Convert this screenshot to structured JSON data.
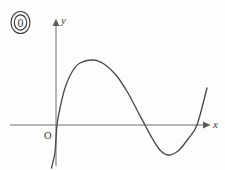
{
  "figure": {
    "tag_label": "0",
    "tag_icon": "circled-zero-icon",
    "background_color": "#fdfdfc",
    "axis_color": "#6e6e6e",
    "curve_color": "#4a4a4a",
    "width": 225,
    "height": 170
  },
  "axes": {
    "x_label": "x",
    "y_label": "y",
    "origin_label": "O",
    "x_axis_y_px": 125,
    "y_axis_x_px": 56,
    "x_axis_start_px": 10,
    "x_axis_end_px": 207,
    "y_axis_top_px": 22,
    "y_axis_bottom_px": 166,
    "x_arrow": "arrow-right-icon",
    "y_arrow": "arrow-up-icon"
  },
  "chart_data": {
    "type": "line",
    "title": "",
    "subtitle": "",
    "xlabel": "x",
    "ylabel": "y",
    "grid": false,
    "legend": false,
    "legend_position": "none",
    "axis_style": "arrowed-cartesian",
    "origin_label": "O",
    "xlim": [
      -0.35,
      4.05
    ],
    "ylim": [
      -1.55,
      1.55
    ],
    "x_roots": [
      0.02,
      1.97,
      3.15
    ],
    "local_maximum": {
      "x": 0.83,
      "y": 1.44
    },
    "local_minimum": {
      "x": 2.5,
      "y": -0.66
    },
    "series": [
      {
        "name": "curve",
        "x": [
          -0.09,
          0.02,
          0.2,
          0.4,
          0.6,
          0.83,
          1.05,
          1.3,
          1.6,
          1.97,
          2.2,
          2.5,
          2.78,
          3.0,
          3.15,
          3.4
        ],
        "y": [
          -0.95,
          0.0,
          0.62,
          1.1,
          1.35,
          1.44,
          1.38,
          1.15,
          0.72,
          0.0,
          -0.4,
          -0.66,
          -0.55,
          -0.2,
          0.0,
          0.82
        ]
      }
    ],
    "path_points_px": [
      [
        51.5,
        168.0
      ],
      [
        55.0,
        152.0
      ],
      [
        57.0,
        125.0
      ],
      [
        60.5,
        106.0
      ],
      [
        65.0,
        88.0
      ],
      [
        72.0,
        72.0
      ],
      [
        80.0,
        63.0
      ],
      [
        93.0,
        60.0
      ],
      [
        104.0,
        64.0
      ],
      [
        116.0,
        75.0
      ],
      [
        128.0,
        93.0
      ],
      [
        138.0,
        112.0
      ],
      [
        145.0,
        125.0
      ],
      [
        152.0,
        138.0
      ],
      [
        160.0,
        150.0
      ],
      [
        168.0,
        155.0
      ],
      [
        178.0,
        151.0
      ],
      [
        188.0,
        139.0
      ],
      [
        197.0,
        125.0
      ],
      [
        207.0,
        88.0
      ]
    ]
  }
}
